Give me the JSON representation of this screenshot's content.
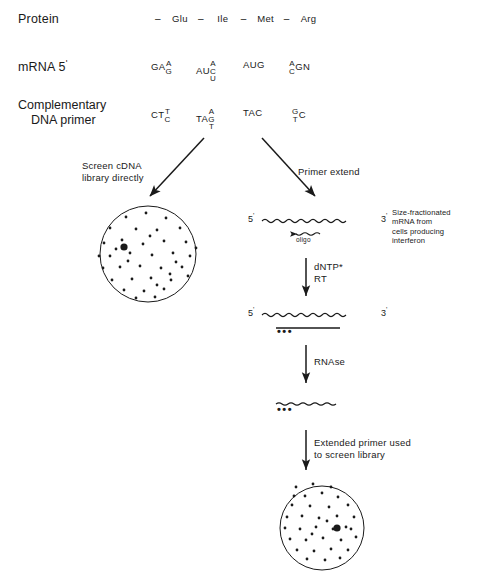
{
  "figure": {
    "type": "molecular-biology-workflow-diagram",
    "rows": {
      "protein": {
        "label": "Protein",
        "residues": [
          "Glu",
          "Ile",
          "Met",
          "Arg"
        ],
        "separator": "–"
      },
      "mrna": {
        "label": "mRNA 5",
        "prime": "'",
        "codons": [
          {
            "prefix": "GA",
            "stack_up": "A",
            "stack_down": "G",
            "suffix": ""
          },
          {
            "prefix": "AU",
            "stack_up": "A",
            "stack_mid": "C",
            "stack_down": "U",
            "suffix": ""
          },
          {
            "prefix": "AUG",
            "stack_up": "",
            "stack_down": "",
            "suffix": ""
          },
          {
            "prefix": "",
            "stack_up": "A",
            "stack_down": "C",
            "suffix": "GN"
          }
        ]
      },
      "primer": {
        "label_line1": "Complementary",
        "label_line2": "DNA primer",
        "codons": [
          {
            "prefix": "CT",
            "stack_up": "T",
            "stack_down": "C",
            "suffix": ""
          },
          {
            "prefix": "TA",
            "stack_up": "A",
            "stack_mid": "G",
            "stack_down": "T",
            "suffix": ""
          },
          {
            "prefix": "TAC",
            "stack_up": "",
            "stack_down": "",
            "suffix": ""
          },
          {
            "prefix": "",
            "stack_up": "G",
            "stack_down": "T",
            "suffix": "C"
          }
        ]
      }
    },
    "branches": {
      "left": {
        "label_line1": "Screen cDNA",
        "label_line2": "library directly"
      },
      "right": {
        "label": "Primer extend"
      }
    },
    "steps": [
      {
        "name": "reverse-transcription",
        "label_line1": "dNTP*",
        "label_line2": "RT"
      },
      {
        "name": "rnase-digestion",
        "label_line1": "RNAse",
        "label_line2": ""
      },
      {
        "name": "library-screen",
        "label_line1": "Extended primer used",
        "label_line2": "to screen library"
      }
    ],
    "strands": {
      "mrna_template": {
        "five_prime": "5",
        "three_prime": "3",
        "prime_mark": "'",
        "oligo_label": "oligo"
      },
      "extended": {
        "five_prime": "5",
        "three_prime": "3",
        "prime_mark": "'",
        "dots": "•••"
      },
      "released": {
        "dots": "•••"
      }
    },
    "side_caption": {
      "line1": "Size-fractionated",
      "line2": "mRNA from",
      "line3": "cells producing",
      "line4": "interferon"
    },
    "plates": [
      {
        "name": "cdna-library-plate",
        "positive_clone": true
      },
      {
        "name": "screened-library-plate",
        "positive_clone": true
      }
    ],
    "colors": {
      "ink": "#1a1a1a",
      "background": "#ffffff"
    }
  }
}
